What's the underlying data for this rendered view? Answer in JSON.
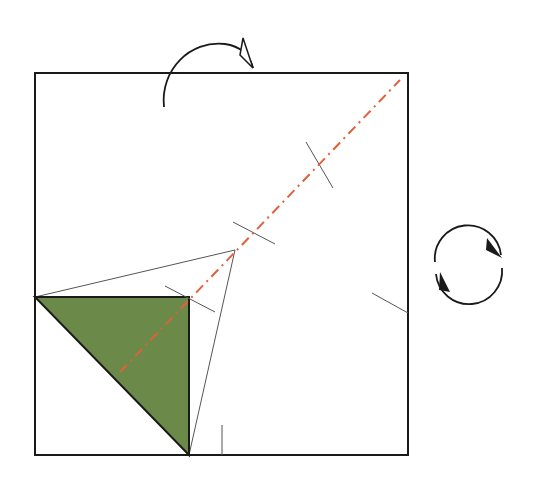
{
  "diagram": {
    "colors": {
      "background": "#ffffff",
      "paper_edge": "#1a1a1a",
      "crease_line": "#555555",
      "colored_side": "#6b8a4a",
      "valley_fold_line": "#e0603a",
      "arrow": "#1a1a1a"
    },
    "paper": {
      "shape": "square",
      "x1": 35,
      "y1": 73,
      "x2": 408,
      "y2": 455
    },
    "folded_flap": {
      "shape": "triangle",
      "points": [
        [
          35,
          297
        ],
        [
          189,
          297
        ],
        [
          189,
          455
        ]
      ],
      "color": "#6b8a4a"
    },
    "fold_line": {
      "type": "mountain-valley dash-dot",
      "from": [
        120,
        372
      ],
      "to": [
        400,
        80
      ]
    },
    "guide_lines": [
      {
        "from": [
          35,
          297
        ],
        "to": [
          235,
          250
        ]
      },
      {
        "from": [
          189,
          455
        ],
        "to": [
          235,
          250
        ]
      }
    ],
    "reference_marks": [
      {
        "from": [
          165,
          286
        ],
        "to": [
          215,
          312
        ]
      },
      {
        "from": [
          233,
          222
        ],
        "to": [
          275,
          244
        ]
      },
      {
        "from": [
          306,
          142
        ],
        "to": [
          333,
          188
        ]
      },
      {
        "from": [
          372,
          293
        ],
        "to": [
          408,
          313
        ]
      },
      {
        "from": [
          222,
          425
        ],
        "to": [
          222,
          455
        ]
      }
    ],
    "symbols": {
      "flip_arrow": "turn-over-arrow",
      "rotate_arrow": "rotate-arrows"
    }
  }
}
